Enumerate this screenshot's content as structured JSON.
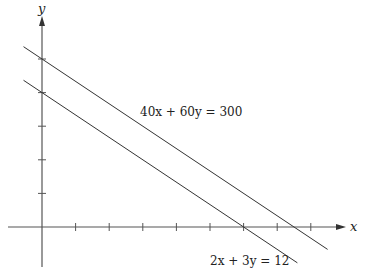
{
  "diagram": {
    "x_axis_label": "x",
    "y_axis_label": "y",
    "x_range": [
      -1,
      9
    ],
    "y_range": [
      -1.5,
      6
    ],
    "x_ticks": [
      1,
      2,
      3,
      4,
      5,
      6,
      7,
      8
    ],
    "y_ticks": [
      1,
      2,
      3,
      4,
      5
    ],
    "lines": [
      {
        "equation": "40x + 60y = 300",
        "a": 40,
        "b": 60,
        "c": 300,
        "x_extent": [
          -0.55,
          8.5
        ]
      },
      {
        "equation": "2x + 3y = 12",
        "a": 2,
        "b": 3,
        "c": 12,
        "x_extent": [
          -0.55,
          7.6
        ]
      }
    ]
  }
}
